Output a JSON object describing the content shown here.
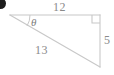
{
  "figure": {
    "type": "right-triangle",
    "background_color": "#ffffff",
    "stroke_color": "#c8c8c8",
    "label_color": "#8a8a8a",
    "marker_color": "#1d1d1d",
    "labels": {
      "top_side": "12",
      "right_side": "5",
      "hypotenuse": "13",
      "angle": "θ"
    },
    "annotations": {
      "right_angle_marker": "right-angle-square",
      "angle_arc": "theta-arc",
      "list_marker": ""
    },
    "geometry": {
      "vertex_left": [
        10,
        15
      ],
      "vertex_top_right": [
        100,
        15
      ],
      "vertex_bottom_right": [
        100,
        67
      ],
      "side_lengths": {
        "adjacent": 12,
        "opposite": 5,
        "hypotenuse": 13
      },
      "right_angle_at": "top-right",
      "theta_at": "left"
    }
  }
}
